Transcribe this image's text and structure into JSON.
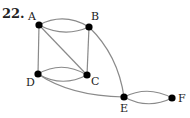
{
  "problem_number": "22.",
  "colors": {
    "edge": "#8a8a8a",
    "node": "#000000",
    "text": "#222222"
  },
  "nodes": [
    {
      "id": "A",
      "label": "A",
      "x": 39,
      "y": 25,
      "lx": 28,
      "ly": 20
    },
    {
      "id": "B",
      "label": "B",
      "x": 89,
      "y": 27,
      "lx": 91,
      "ly": 20
    },
    {
      "id": "C",
      "label": "C",
      "x": 87,
      "y": 75,
      "lx": 91,
      "ly": 85
    },
    {
      "id": "D",
      "label": "D",
      "x": 38,
      "y": 74,
      "lx": 26,
      "ly": 86
    },
    {
      "id": "E",
      "label": "E",
      "x": 124,
      "y": 97,
      "lx": 120,
      "ly": 112
    },
    {
      "id": "F",
      "label": "F",
      "x": 172,
      "y": 98,
      "lx": 178,
      "ly": 102
    }
  ],
  "edges": [
    {
      "from": "A",
      "to": "B",
      "path": "M39,25 Q64,12 89,27"
    },
    {
      "from": "A",
      "to": "B",
      "path": "M39,25 Q64,38 89,27"
    },
    {
      "from": "A",
      "to": "D",
      "path": "M39,25 L38,74"
    },
    {
      "from": "A",
      "to": "C",
      "path": "M39,25 L87,75"
    },
    {
      "from": "B",
      "to": "C",
      "path": "M89,27 L87,75"
    },
    {
      "from": "D",
      "to": "C",
      "path": "M38,74 Q62,60 87,75"
    },
    {
      "from": "D",
      "to": "C",
      "path": "M38,74 Q62,88 87,75"
    },
    {
      "from": "B",
      "to": "E",
      "path": "M89,27 Q118,55 124,97"
    },
    {
      "from": "D",
      "to": "E",
      "path": "M38,74 Q70,96 124,97"
    },
    {
      "from": "E",
      "to": "F",
      "path": "M124,97 Q148,85 172,98"
    },
    {
      "from": "E",
      "to": "F",
      "path": "M124,97 Q148,110 172,98"
    }
  ]
}
